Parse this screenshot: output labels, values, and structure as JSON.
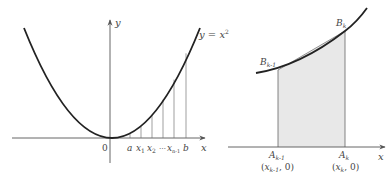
{
  "figure": {
    "left_panel": {
      "curve_label": "y = x²",
      "curve_label_y": "y",
      "curve_label_eq": " = ",
      "curve_label_x": "x",
      "curve_label_exp": "2",
      "axis_x_label": "x",
      "axis_y_label": "y",
      "origin_label": "0",
      "partition_labels": [
        "a",
        "x",
        "x",
        "…",
        "x",
        "b"
      ],
      "partition_subscripts": [
        "",
        "1",
        "2",
        "",
        "n-1",
        ""
      ]
    },
    "right_panel": {
      "axis_x_label": "x",
      "point_B_prev": "B",
      "point_B_prev_sub": "k-1",
      "point_B_curr": "B",
      "point_B_curr_sub": "k",
      "point_A_prev": "A",
      "point_A_prev_sub": "k-1",
      "point_A_curr": "A",
      "point_A_curr_sub": "k",
      "coord_A_prev_open": "(",
      "coord_A_prev_x": "x",
      "coord_A_prev_sub": "k-1",
      "coord_A_prev_close": ", 0)",
      "coord_A_curr_open": "(",
      "coord_A_curr_x": "x",
      "coord_A_curr_sub": "k",
      "coord_A_curr_close": ", 0)"
    },
    "colors": {
      "stroke": "#222222",
      "thin_stroke": "#555555",
      "shade": "#e6e6e6",
      "text": "#444444"
    }
  }
}
